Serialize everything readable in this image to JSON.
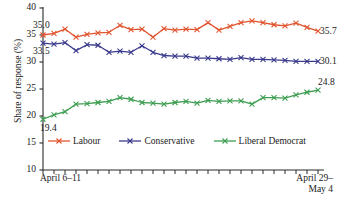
{
  "chart_data": {
    "type": "line",
    "title": "",
    "xlabel": "",
    "ylabel": "Share of response (%)",
    "ylim": [
      10,
      40
    ],
    "yticks": [
      10,
      15,
      20,
      25,
      30,
      35,
      40
    ],
    "ytick_labels": [
      "10",
      "15",
      "20",
      "25",
      "30",
      "35",
      "40"
    ],
    "grid": false,
    "legend_position": "inside-bottom-left",
    "n_points": 26,
    "x_tick_count": 26,
    "x_axis_labels": {
      "left": "April 6–11",
      "right_line1": "April 29–",
      "right_line2": "May 4"
    },
    "series": [
      {
        "name": "Labour",
        "color": "#E05530",
        "marker": "x",
        "start_label": "35.0",
        "end_label": "35.7",
        "values": [
          35.0,
          35.3,
          36.1,
          34.6,
          35.1,
          35.4,
          35.5,
          36.8,
          36.0,
          36.1,
          34.6,
          36.2,
          35.9,
          36.1,
          36.0,
          37.3,
          35.9,
          36.6,
          37.3,
          37.6,
          37.3,
          36.9,
          36.7,
          37.2,
          36.4,
          35.7
        ]
      },
      {
        "name": "Conservative",
        "color": "#3A3A8C",
        "marker": "x",
        "start_label": "33.5",
        "end_label": "30.1",
        "values": [
          33.5,
          33.3,
          33.6,
          32.1,
          33.2,
          33.1,
          31.8,
          32.0,
          31.8,
          33.0,
          31.8,
          31.2,
          31.1,
          31.1,
          30.7,
          30.7,
          30.6,
          30.5,
          30.8,
          30.5,
          30.5,
          30.4,
          30.3,
          30.1,
          30.1,
          30.1
        ]
      },
      {
        "name": "Liberal Democrat",
        "color": "#3E9E52",
        "marker": "x",
        "start_label": "19.4",
        "end_label": "24.8",
        "values": [
          19.4,
          20.2,
          20.8,
          22.2,
          22.3,
          22.5,
          22.7,
          23.4,
          23.1,
          22.5,
          22.4,
          22.2,
          22.5,
          22.7,
          22.4,
          22.9,
          22.7,
          22.8,
          22.8,
          22.2,
          23.4,
          23.4,
          23.3,
          23.9,
          24.4,
          24.8
        ]
      }
    ]
  }
}
